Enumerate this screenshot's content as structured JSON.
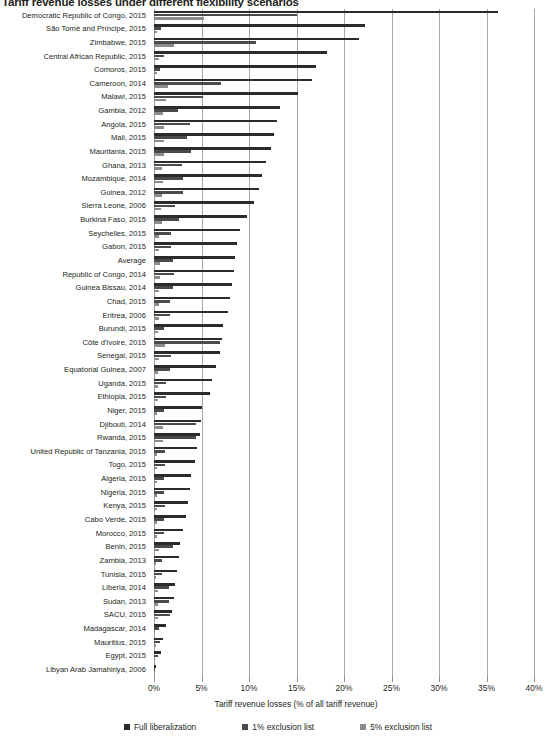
{
  "chart_data": {
    "type": "bar",
    "orientation": "horizontal",
    "title": "Tariff revenue losses under different flexibility scenarios",
    "xlabel": "Tariff revenue losses (% of all tariff revenue)",
    "ylabel": "",
    "xlim": [
      0,
      40
    ],
    "xticks": [
      "0%",
      "5%",
      "10%",
      "15%",
      "20%",
      "25%",
      "30%",
      "35%",
      "40%"
    ],
    "xtick_values": [
      0,
      5,
      10,
      15,
      20,
      25,
      30,
      35,
      40
    ],
    "grid": true,
    "legend_position": "bottom",
    "colors": {
      "full": "#2b2b2b",
      "one": "#4a4a4a",
      "five": "#8c8c8c"
    },
    "series": [
      {
        "name": "Full liberalization",
        "key": "full",
        "color": "#2b2b2b"
      },
      {
        "name": "1% exclusion list",
        "key": "one",
        "color": "#4a4a4a"
      },
      {
        "name": "5% exclusion list",
        "key": "five",
        "color": "#8c8c8c"
      }
    ],
    "categories": [
      "Democratic Republic of Congo, 2015",
      "São Tomé and Príncipe, 2015",
      "Zimbabwe, 2015",
      "Central African Republic, 2015",
      "Comoros, 2015",
      "Cameroon, 2014",
      "Malawi, 2015",
      "Gambia, 2012",
      "Angola, 2015",
      "Mali, 2015",
      "Mauritania, 2015",
      "Ghana, 2013",
      "Mozambique, 2014",
      "Guinea, 2012",
      "Sierra Leone, 2006",
      "Burkina Faso, 2015",
      "Seychelles, 2015",
      "Gabon, 2015",
      "Average",
      "Republic of Congo, 2014",
      "Guinea Bissau, 2014",
      "Chad, 2015",
      "Eritrea, 2006",
      "Burundi, 2015",
      "Côte d'Ivoire, 2015",
      "Senegal, 2015",
      "Equatorial Guinea, 2007",
      "Uganda, 2015",
      "Ethiopia, 2015",
      "Niger, 2015",
      "Djibouti, 2014",
      "Rwanda, 2015",
      "United Republic of Tanzania, 2015",
      "Togo, 2015",
      "Algeria, 2015",
      "Nigeria, 2015",
      "Kenya, 2015",
      "Cabo Verde, 2015",
      "Morocco, 2015",
      "Benin, 2015",
      "Zambia, 2013",
      "Tunisia, 2015",
      "Liberia, 2014",
      "Sudan, 2013",
      "SACU, 2015",
      "Madagascar, 2014",
      "Mauritius, 2015",
      "Egypt, 2015",
      "Libyan Arab Jamahiriya, 2006"
    ],
    "values": {
      "full": [
        36.2,
        22.2,
        21.6,
        18.2,
        17.0,
        16.6,
        15.2,
        13.3,
        12.9,
        12.6,
        12.3,
        11.8,
        11.4,
        11.0,
        10.5,
        9.8,
        9.0,
        8.7,
        8.5,
        8.4,
        8.2,
        8.0,
        7.8,
        7.3,
        7.2,
        6.9,
        6.5,
        6.1,
        5.9,
        5.1,
        4.9,
        4.8,
        4.5,
        4.3,
        3.9,
        3.8,
        3.6,
        3.4,
        3.1,
        2.7,
        2.6,
        2.4,
        2.2,
        2.1,
        1.9,
        1.3,
        0.9,
        0.7,
        0.2
      ],
      "one": [
        15.0,
        0.7,
        10.7,
        1.0,
        0.6,
        7.0,
        5.2,
        2.5,
        3.8,
        3.5,
        3.9,
        2.9,
        3.1,
        3.0,
        2.2,
        2.6,
        1.8,
        1.8,
        2.0,
        2.1,
        2.0,
        1.7,
        1.7,
        1.1,
        6.9,
        1.8,
        1.7,
        1.3,
        1.3,
        1.1,
        4.4,
        4.4,
        1.2,
        1.2,
        1.0,
        1.0,
        1.2,
        1.1,
        1.0,
        2.0,
        0.8,
        0.8,
        1.6,
        1.6,
        1.7,
        0.5,
        0.6,
        0.4,
        0.1
      ],
      "five": [
        5.3,
        0.3,
        2.1,
        0.5,
        0.3,
        1.5,
        1.3,
        0.9,
        1.1,
        1.0,
        1.1,
        0.8,
        0.9,
        0.8,
        0.7,
        0.8,
        0.5,
        0.5,
        0.6,
        0.6,
        0.5,
        0.5,
        0.5,
        0.4,
        1.2,
        0.5,
        0.4,
        0.4,
        0.4,
        0.3,
        0.9,
        0.9,
        0.3,
        0.3,
        0.3,
        0.3,
        0.3,
        0.3,
        0.3,
        0.5,
        0.2,
        0.2,
        0.4,
        0.4,
        0.4,
        0.1,
        0.2,
        0.1,
        0.05
      ]
    }
  },
  "legend": {
    "items": [
      {
        "label": "Full liberalization",
        "key": "full"
      },
      {
        "label": "1% exclusion list",
        "key": "one"
      },
      {
        "label": "5% exclusion list",
        "key": "five"
      }
    ]
  }
}
